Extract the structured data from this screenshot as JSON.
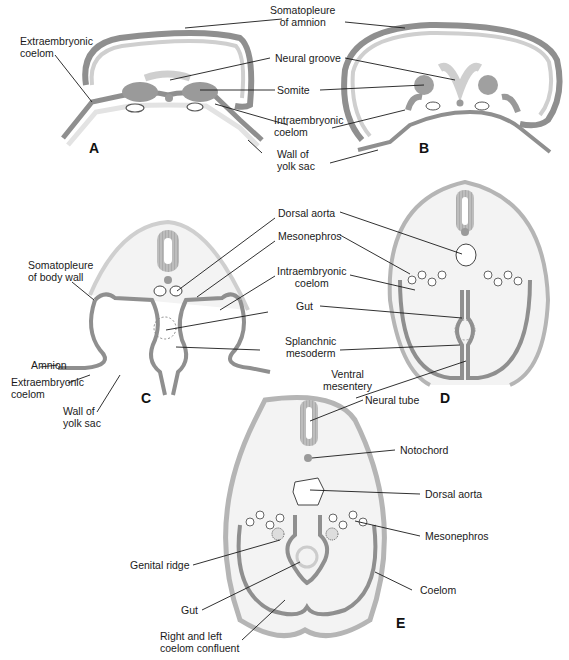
{
  "figure": {
    "colors": {
      "ectoderm": "#8f8f8f",
      "mesoderm_fill": "#bdbdbd",
      "light_fill": "#f3f3f3",
      "endoderm": "#d9d9d9",
      "line": "#1a1a1a",
      "background": "#ffffff"
    },
    "panels": [
      {
        "id": "A",
        "label": "A"
      },
      {
        "id": "B",
        "label": "B"
      },
      {
        "id": "C",
        "label": "C"
      },
      {
        "id": "D",
        "label": "D"
      },
      {
        "id": "E",
        "label": "E"
      }
    ],
    "labels": {
      "somatopleure_amnion": "Somatopleure\nof amnion",
      "extraembryonic_coelom_a": "Extraembryonic\ncoelom",
      "neural_groove": "Neural groove",
      "somite": "Somite",
      "intraembryonic_coelom_ab": "Intraembryonic\ncoelom",
      "wall_yolk_sac_ab": "Wall of\nyolk sac",
      "dorsal_aorta_cd": "Dorsal aorta",
      "mesonephros_cd": "Mesonephros",
      "somatopleure_body_wall": "Somatopleure\nof body wall",
      "intraembryonic_coelom_cd": "Intraembryonic\ncoelom",
      "gut_cd": "Gut",
      "splanchnic_mesoderm": "Splanchnic\nmesoderm",
      "amnion": "Amnion",
      "extraembryonic_coelom_c": "Extraembryonic\ncoelom",
      "wall_yolk_sac_c": "Wall of\nyolk sac",
      "ventral_mesentery": "Ventral\nmesentery",
      "neural_tube": "Neural tube",
      "notochord": "Notochord",
      "dorsal_aorta_e": "Dorsal aorta",
      "mesonephros_e": "Mesonephros",
      "genital_ridge": "Genital ridge",
      "coelom": "Coelom",
      "gut_e": "Gut",
      "coelom_confluent": "Right and left\ncoelom confluent"
    }
  }
}
